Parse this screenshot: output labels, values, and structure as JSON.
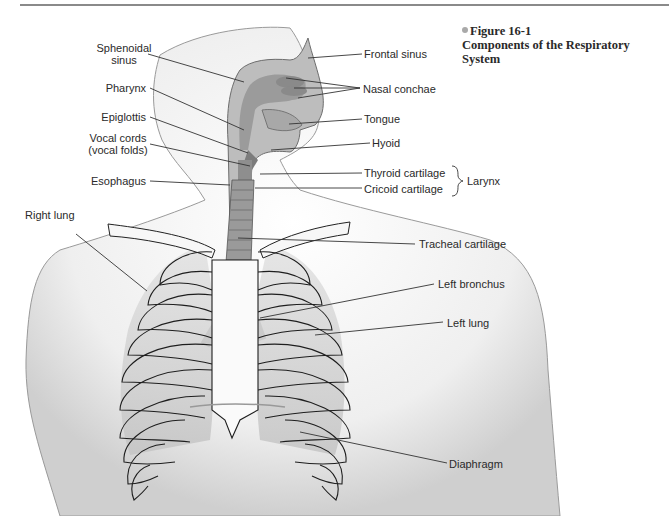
{
  "figure": {
    "number": "Figure 16-1",
    "title": "Components of the Respiratory System"
  },
  "labels_left": {
    "sphenoidal_sinus_line1": "Sphenoidal",
    "sphenoidal_sinus_line2": "sinus",
    "pharynx": "Pharynx",
    "epiglottis": "Epiglottis",
    "vocal_cords_line1": "Vocal cords",
    "vocal_cords_line2": "(vocal folds)",
    "esophagus": "Esophagus",
    "right_lung": "Right lung"
  },
  "labels_right": {
    "frontal_sinus": "Frontal sinus",
    "nasal_conchae": "Nasal conchae",
    "tongue": "Tongue",
    "hyoid": "Hyoid",
    "thyroid_cartilage": "Thyroid cartilage",
    "cricoid_cartilage": "Cricoid cartilage",
    "larynx": "Larynx",
    "tracheal_cartilage": "Tracheal cartilage",
    "left_bronchus": "Left bronchus",
    "left_lung": "Left lung",
    "diaphragm": "Diaphragm"
  },
  "colors": {
    "skin": "#ececec",
    "skin_shadow": "#c9c9c9",
    "outline": "#2b2b2b",
    "airway": "#8c8c8c",
    "lung": "#cfcfcf",
    "leader_line": "#333333"
  }
}
